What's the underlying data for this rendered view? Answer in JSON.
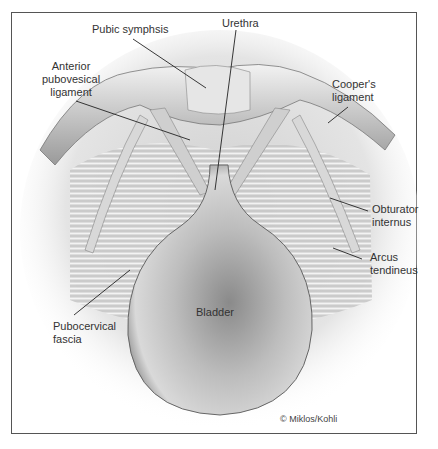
{
  "figure": {
    "labels": {
      "pubic_symphysis": "Pubic symphsis",
      "urethra": "Urethra",
      "anterior_pubovesical_1": "Anterior",
      "anterior_pubovesical_2": "pubovesical",
      "anterior_pubovesical_3": "ligament",
      "coopers_1": "Cooper's",
      "coopers_2": "ligament",
      "obturator_1": "Obturator",
      "obturator_2": "internus",
      "arcus_1": "Arcus",
      "arcus_2": "tendineus",
      "pubocervical_1": "Pubocervical",
      "pubocervical_2": "fascia",
      "bladder": "Bladder"
    },
    "credit": "© Miklos/Kohli",
    "colors": {
      "border": "#555555",
      "tissue_dark": "#6a6a6a",
      "tissue_light": "#e8e8e8",
      "leader": "#222222"
    }
  }
}
